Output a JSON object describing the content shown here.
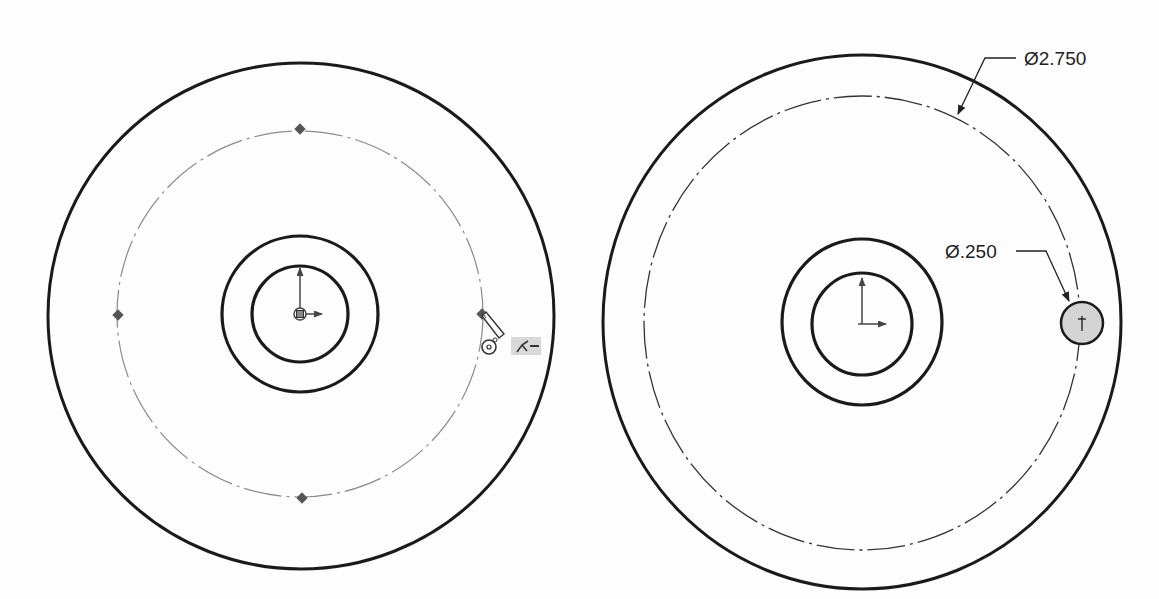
{
  "views": {
    "left": {
      "description": "Sketch in progress: concentric circles with construction circle and inference points",
      "sketch_tool_icons": [
        "pencil-cursor-icon",
        "concentric-relation-icon",
        "coincident-relation-icon"
      ]
    },
    "right": {
      "dimensions": {
        "bolt_circle": "Ø2.750",
        "hole": "Ø.250"
      }
    }
  },
  "colors": {
    "geometry": "#1a1a1a",
    "construction": "#555555",
    "hole_fill": "#d4d4d4",
    "point": "#555555",
    "highlight": "#d8d8d8"
  }
}
